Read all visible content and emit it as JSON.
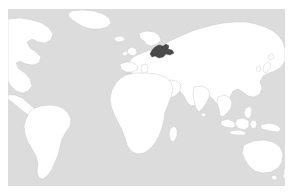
{
  "figure": {
    "kind": "world-locator-map",
    "title": "World locator map",
    "caption": "",
    "projection": "equirectangular",
    "centered_on": "Europe / Africa / Asia",
    "background_color": "#ffffff",
    "margin_px": 8
  },
  "map": {
    "ocean_color": "#dcdcdc",
    "land_color": "#ffffff",
    "coastline_color": "#c6c6c6",
    "highlight_color": "#4a4a4a",
    "highlight_region": "Belarus",
    "highlight_label": "",
    "graticule": false,
    "labels_visible": false,
    "viewbox": {
      "x_min": 0,
      "y_min": 0,
      "width": 277,
      "height": 177
    },
    "visible_landmasses": [
      "North America (eastern sliver)",
      "South America",
      "Greenland",
      "Europe",
      "Africa",
      "Asia",
      "Indonesia",
      "Australia",
      "Japan",
      "Madagascar",
      "British Isles",
      "Iceland",
      "Scandinavia",
      "New Guinea",
      "Philippines",
      "Sri Lanka",
      "New Zealand (edge)"
    ]
  }
}
